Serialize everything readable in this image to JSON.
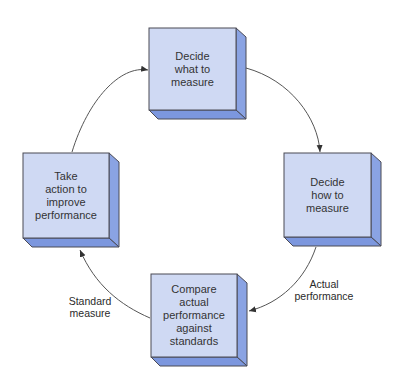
{
  "diagram": {
    "type": "cycle",
    "colors": {
      "front": "#cfd9f3",
      "side": "#8aa3e3",
      "bottom": "#7c97de",
      "border": "#4a4a55",
      "arrow": "#444444"
    },
    "nodes": [
      {
        "id": "decide-what",
        "label": "Decide\nwhat to\nmeasure"
      },
      {
        "id": "decide-how",
        "label": "Decide\nhow to\nmeasure"
      },
      {
        "id": "compare",
        "label": "Compare\nactual\nperformance\nagainst\nstandards"
      },
      {
        "id": "take-action",
        "label": "Take\naction to\nimprove\nperformance"
      }
    ],
    "edges": [
      {
        "from": "take-action",
        "to": "decide-what",
        "label": ""
      },
      {
        "from": "decide-what",
        "to": "decide-how",
        "label": ""
      },
      {
        "from": "decide-how",
        "to": "compare",
        "label": "Actual\nperformance"
      },
      {
        "from": "compare",
        "to": "take-action",
        "label": "Standard\nmeasure"
      }
    ]
  }
}
